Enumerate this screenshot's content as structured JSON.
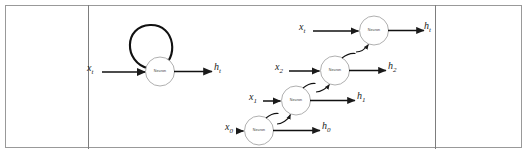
{
  "figure": {
    "neuron_label": "Neuron",
    "colors": {
      "frame": "#999999",
      "divider": "#7d7d7d",
      "stroke": "#1a1a1a",
      "circle_stroke": "#8c8c8c",
      "background": "#ffffff"
    },
    "panels": [
      {
        "name": "folded",
        "description": "Single neuron with recurrent self-loop"
      },
      {
        "name": "unrolled",
        "description": "Unrolled recurrence across time steps"
      }
    ]
  },
  "folded": {
    "input_label": "x",
    "input_sub": "t",
    "output_label": "h",
    "output_sub": "t",
    "neuron": "Neuron"
  },
  "unrolled": {
    "steps": [
      {
        "input_label": "x",
        "input_sub": "0",
        "output_label": "h",
        "output_sub": "0",
        "neuron": "Neuron"
      },
      {
        "input_label": "x",
        "input_sub": "1",
        "output_label": "h",
        "output_sub": "1",
        "neuron": "Neuron"
      },
      {
        "input_label": "x",
        "input_sub": "2",
        "output_label": "h",
        "output_sub": "2",
        "neuron": "Neuron"
      },
      {
        "input_label": "x",
        "input_sub": "t",
        "output_label": "h",
        "output_sub": "t",
        "neuron": "Neuron"
      }
    ]
  }
}
